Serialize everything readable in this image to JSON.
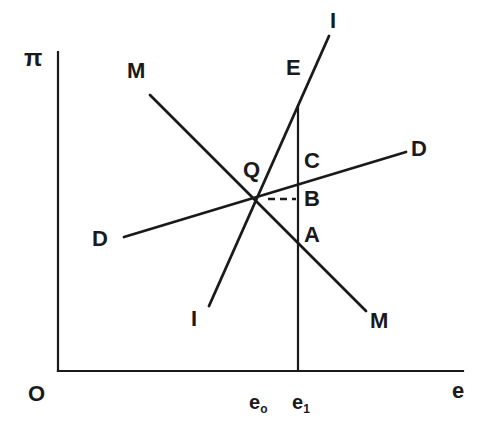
{
  "figure": {
    "type": "line-diagram",
    "background_color": "#ffffff",
    "stroke_color": "#1a1a1a",
    "axes": {
      "y_axis_label": "π",
      "x_axis_label": "e",
      "origin_label": "O",
      "x_axis": {
        "x1": 58,
        "y1": 371,
        "x2": 463,
        "y2": 371
      },
      "y_axis": {
        "x1": 58,
        "y1": 52,
        "x2": 58,
        "y2": 371
      }
    },
    "ticks": [
      {
        "name": "e-zero",
        "label": "e",
        "sub": "o",
        "x": 249,
        "y": 392
      },
      {
        "name": "e-one",
        "label": "e",
        "sub": "1",
        "x": 292,
        "y": 392
      }
    ],
    "curves": [
      {
        "name": "mm-curve",
        "label": "M",
        "description": "downward sloping MM schedule",
        "x1": 150,
        "y1": 95,
        "x2": 366,
        "y2": 311
      },
      {
        "name": "dd-curve",
        "label": "D",
        "description": "upward sloping shallow DD schedule",
        "x1": 124,
        "y1": 237,
        "x2": 406,
        "y2": 152
      },
      {
        "name": "ii-curve",
        "label": "I",
        "description": "steep upward sloping II schedule",
        "x1": 209,
        "y1": 306,
        "x2": 329,
        "y2": 36
      },
      {
        "name": "vertical-line-e1",
        "label": "",
        "description": "vertical line at e1 from E down to x-axis",
        "x1": 298,
        "y1": 105,
        "x2": 298,
        "y2": 371
      },
      {
        "name": "dashed-segment-qb",
        "label": "",
        "description": "short dashed horizontal segment from Q to B",
        "x1": 268,
        "y1": 199,
        "x2": 296,
        "y2": 199
      }
    ],
    "labels": [
      {
        "name": "label-m-upper-left",
        "text": "M",
        "x": 127,
        "y": 60,
        "kind": "curve"
      },
      {
        "name": "label-m-lower-right",
        "text": "M",
        "x": 370,
        "y": 310,
        "kind": "curve"
      },
      {
        "name": "label-d-left",
        "text": "D",
        "x": 92,
        "y": 228,
        "kind": "curve"
      },
      {
        "name": "label-d-right",
        "text": "D",
        "x": 411,
        "y": 138,
        "kind": "curve"
      },
      {
        "name": "label-i-upper",
        "text": "I",
        "x": 330,
        "y": 10,
        "kind": "curve"
      },
      {
        "name": "label-i-lower",
        "text": "I",
        "x": 191,
        "y": 308,
        "kind": "curve"
      },
      {
        "name": "label-point-q",
        "text": "Q",
        "x": 243,
        "y": 159,
        "kind": "point"
      },
      {
        "name": "label-point-e",
        "text": "E",
        "x": 286,
        "y": 57,
        "kind": "point"
      },
      {
        "name": "label-point-c",
        "text": "C",
        "x": 304,
        "y": 150,
        "kind": "point"
      },
      {
        "name": "label-point-b",
        "text": "B",
        "x": 304,
        "y": 188,
        "kind": "point"
      },
      {
        "name": "label-point-a",
        "text": "A",
        "x": 304,
        "y": 224,
        "kind": "point"
      }
    ],
    "points_of_interest": {
      "q_intersection": {
        "x": 256,
        "y": 200,
        "description": "equilibrium intersection of MM, DD and II"
      },
      "e_top": {
        "x": 298,
        "y": 105
      },
      "c_on_dd": {
        "x": 298,
        "y": 188
      },
      "b_on_dashed": {
        "x": 298,
        "y": 199
      },
      "a_on_mm": {
        "x": 298,
        "y": 237
      }
    },
    "axis_labels": {
      "origin": {
        "text": "O",
        "x": 28,
        "y": 383
      },
      "y_axis": {
        "text": "π",
        "x": 24,
        "y": 46
      },
      "x_axis": {
        "text": "e",
        "x": 452,
        "y": 380
      }
    }
  }
}
